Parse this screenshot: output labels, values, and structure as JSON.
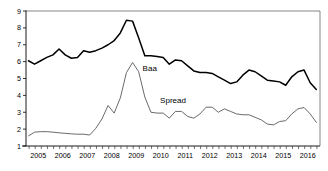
{
  "chart_data": {
    "type": "line",
    "title": "",
    "subtitle": "",
    "xlabel": "",
    "ylabel": "",
    "xlim": [
      2004.5,
      2016.5
    ],
    "ylim": [
      1,
      9
    ],
    "grid": false,
    "legend_position": "inline-annotations",
    "y_ticks": [
      1,
      2,
      3,
      4,
      5,
      6,
      7,
      8,
      9
    ],
    "y_tick_labels": [
      "1",
      "2",
      "3",
      "4",
      "5",
      "6",
      "7",
      "8",
      "9"
    ],
    "x_tick_labels": [
      "2005",
      "2006",
      "2007",
      "2008",
      "2009",
      "2010",
      "2011",
      "2012",
      "2013",
      "2014",
      "2015",
      "2016"
    ],
    "x_tick_values": [
      2005,
      2006,
      2007,
      2008,
      2009,
      2010,
      2011,
      2012,
      2013,
      2014,
      2015,
      2016
    ],
    "x_minor_ticks_per_year": 4,
    "annotations": [
      {
        "text": "Baa",
        "x": 2009.55,
        "y": 5.47
      },
      {
        "text": "Spread",
        "x": 2010.5,
        "y": 3.52
      }
    ],
    "series": [
      {
        "name": "Baa",
        "color": "#000000",
        "line_width": 1.5,
        "x": [
          2004.6,
          2004.85,
          2005.1,
          2005.35,
          2005.6,
          2005.85,
          2006.1,
          2006.35,
          2006.6,
          2006.85,
          2007.1,
          2007.35,
          2007.6,
          2007.85,
          2008.1,
          2008.35,
          2008.6,
          2008.85,
          2009.1,
          2009.35,
          2009.6,
          2009.85,
          2010.1,
          2010.35,
          2010.6,
          2010.85,
          2011.1,
          2011.35,
          2011.6,
          2011.85,
          2012.1,
          2012.35,
          2012.6,
          2012.85,
          2013.1,
          2013.35,
          2013.6,
          2013.85,
          2014.1,
          2014.35,
          2014.6,
          2014.85,
          2015.1,
          2015.35,
          2015.6,
          2015.85,
          2016.1,
          2016.35
        ],
        "values": [
          6.05,
          5.85,
          6.05,
          6.25,
          6.4,
          6.75,
          6.4,
          6.2,
          6.25,
          6.65,
          6.55,
          6.65,
          6.8,
          7.0,
          7.25,
          7.7,
          8.45,
          8.4,
          7.4,
          6.35,
          6.35,
          6.3,
          6.25,
          5.85,
          6.1,
          6.05,
          5.75,
          5.45,
          5.35,
          5.35,
          5.3,
          5.1,
          4.9,
          4.7,
          4.8,
          5.2,
          5.5,
          5.4,
          5.15,
          4.9,
          4.85,
          4.8,
          4.6,
          5.1,
          5.4,
          5.5,
          4.75,
          4.35
        ]
      },
      {
        "name": "Spread",
        "color": "#444444",
        "line_width": 0.8,
        "x": [
          2004.6,
          2004.85,
          2005.1,
          2005.35,
          2005.6,
          2005.85,
          2006.1,
          2006.35,
          2006.6,
          2006.85,
          2007.1,
          2007.35,
          2007.6,
          2007.85,
          2008.1,
          2008.35,
          2008.6,
          2008.85,
          2009.1,
          2009.35,
          2009.6,
          2009.85,
          2010.1,
          2010.35,
          2010.6,
          2010.85,
          2011.1,
          2011.35,
          2011.6,
          2011.85,
          2012.1,
          2012.35,
          2012.6,
          2012.85,
          2013.1,
          2013.35,
          2013.6,
          2013.85,
          2014.1,
          2014.35,
          2014.6,
          2014.85,
          2015.1,
          2015.35,
          2015.6,
          2015.85,
          2016.1,
          2016.35
        ],
        "values": [
          1.6,
          1.82,
          1.85,
          1.85,
          1.82,
          1.78,
          1.75,
          1.72,
          1.7,
          1.7,
          1.65,
          2.05,
          2.6,
          3.4,
          2.95,
          3.85,
          5.35,
          5.95,
          5.4,
          3.9,
          3.0,
          2.95,
          2.95,
          2.65,
          3.05,
          3.05,
          2.75,
          2.65,
          2.9,
          3.3,
          3.3,
          3.0,
          3.2,
          3.05,
          2.9,
          2.85,
          2.85,
          2.7,
          2.55,
          2.3,
          2.25,
          2.45,
          2.5,
          2.9,
          3.2,
          3.28,
          2.9,
          2.4
        ]
      }
    ]
  },
  "plot_geometry": {
    "left": 26,
    "right": 320,
    "top": 11,
    "bottom": 146
  }
}
